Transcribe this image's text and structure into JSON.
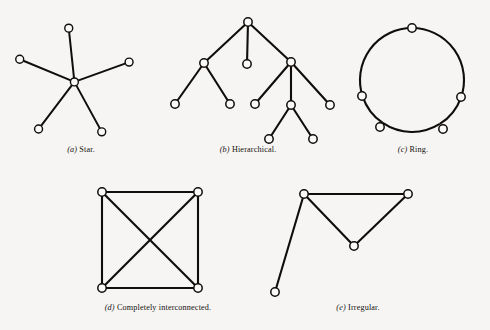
{
  "figure": {
    "background_color": "#f6f5f3",
    "ink_color": "#100d0b",
    "node_fill_color": "#faf9f7",
    "panels": [
      {
        "id": "star",
        "caption_tag": "(a)",
        "caption_text": "Star.",
        "topology": "star"
      },
      {
        "id": "hierarchical",
        "caption_tag": "(b)",
        "caption_text": "Hierarchical.",
        "topology": "tree"
      },
      {
        "id": "ring",
        "caption_tag": "(c)",
        "caption_text": "Ring.",
        "topology": "ring"
      },
      {
        "id": "completely-interconnected",
        "caption_tag": "(d)",
        "caption_text": "Completely interconnected.",
        "topology": "complete-graph"
      },
      {
        "id": "irregular",
        "caption_tag": "(e)",
        "caption_text": "Irregular.",
        "topology": "irregular"
      }
    ]
  },
  "chart_data": {
    "type": "diagram",
    "title": "",
    "subtitle": "",
    "diagram_kind": "network-topology-plate",
    "graphs": [
      {
        "id": "star",
        "label": "Star",
        "caption": "(a) Star.",
        "node_radius": 4.2,
        "node_count": 6,
        "edge_count": 5,
        "nodes": [
          {
            "id": "hub",
            "x": 72,
            "y": 72
          },
          {
            "id": "n-top",
            "x": 66,
            "y": 15
          },
          {
            "id": "n-left",
            "x": 14,
            "y": 48
          },
          {
            "id": "n-right",
            "x": 130,
            "y": 51
          },
          {
            "id": "n-bottom-left",
            "x": 34,
            "y": 122
          },
          {
            "id": "n-bottom-right",
            "x": 101,
            "y": 125
          }
        ],
        "edges": [
          [
            "hub",
            "n-top"
          ],
          [
            "hub",
            "n-left"
          ],
          [
            "hub",
            "n-right"
          ],
          [
            "hub",
            "n-bottom-left"
          ],
          [
            "hub",
            "n-bottom-right"
          ]
        ]
      },
      {
        "id": "hierarchical",
        "label": "Hierarchical",
        "caption": "(b) Hierarchical.",
        "node_radius": 4.2,
        "node_count": 11,
        "edge_count": 10,
        "nodes": [
          {
            "id": "root",
            "x": 90,
            "y": 14
          },
          {
            "id": "l1-left",
            "x": 46,
            "y": 55
          },
          {
            "id": "l1-mid",
            "x": 89,
            "y": 56
          },
          {
            "id": "l1-right",
            "x": 133,
            "y": 54
          },
          {
            "id": "l2-a",
            "x": 17,
            "y": 96
          },
          {
            "id": "l2-b",
            "x": 72,
            "y": 96
          },
          {
            "id": "l2-c",
            "x": 97,
            "y": 96
          },
          {
            "id": "l2-mid",
            "x": 133,
            "y": 97
          },
          {
            "id": "l2-d",
            "x": 172,
            "y": 97
          },
          {
            "id": "l3-a",
            "x": 111,
            "y": 131
          },
          {
            "id": "l3-b",
            "x": 155,
            "y": 131
          }
        ],
        "edges": [
          [
            "root",
            "l1-left"
          ],
          [
            "root",
            "l1-mid"
          ],
          [
            "root",
            "l1-right"
          ],
          [
            "l1-left",
            "l2-a"
          ],
          [
            "l1-left",
            "l2-b"
          ],
          [
            "l1-right",
            "l2-c"
          ],
          [
            "l1-right",
            "l2-mid"
          ],
          [
            "l1-right",
            "l2-d"
          ],
          [
            "l2-mid",
            "l3-a"
          ],
          [
            "l2-mid",
            "l3-b"
          ]
        ]
      },
      {
        "id": "ring",
        "label": "Ring",
        "caption": "(c) Ring.",
        "node_radius": 4.2,
        "node_count": 5,
        "edge_count": 5,
        "ring_center": {
          "x": 74,
          "y": 66
        },
        "ring_radius": 52,
        "nodes": [
          {
            "id": "r-top",
            "x": 74,
            "y": 14,
            "angle_deg": 270
          },
          {
            "id": "r-right",
            "x": 123,
            "y": 83,
            "angle_deg": 20
          },
          {
            "id": "r-bottom-right",
            "x": 105,
            "y": 115,
            "angle_deg": 71
          },
          {
            "id": "r-bottom-left",
            "x": 42,
            "y": 113,
            "angle_deg": 115
          },
          {
            "id": "r-left",
            "x": 24,
            "y": 82,
            "angle_deg": 162
          }
        ],
        "edges": [
          [
            "r-top",
            "r-right"
          ],
          [
            "r-right",
            "r-bottom-right"
          ],
          [
            "r-bottom-right",
            "r-bottom-left"
          ],
          [
            "r-bottom-left",
            "r-left"
          ],
          [
            "r-left",
            "r-top"
          ]
        ]
      },
      {
        "id": "completely-interconnected",
        "label": "Completely interconnected",
        "caption": "(d) Completely interconnected.",
        "node_radius": 4.2,
        "node_count": 4,
        "edge_count": 6,
        "nodes": [
          {
            "id": "c-top-left",
            "x": 44,
            "y": 14
          },
          {
            "id": "c-top-right",
            "x": 140,
            "y": 14
          },
          {
            "id": "c-bottom-left",
            "x": 44,
            "y": 110
          },
          {
            "id": "c-bottom-right",
            "x": 140,
            "y": 110
          }
        ],
        "edges": [
          [
            "c-top-left",
            "c-top-right"
          ],
          [
            "c-top-left",
            "c-bottom-left"
          ],
          [
            "c-top-right",
            "c-bottom-right"
          ],
          [
            "c-bottom-left",
            "c-bottom-right"
          ],
          [
            "c-top-left",
            "c-bottom-right"
          ],
          [
            "c-top-right",
            "c-bottom-left"
          ]
        ]
      },
      {
        "id": "irregular",
        "label": "Irregular",
        "caption": "(e) Irregular.",
        "node_radius": 4.2,
        "node_count": 4,
        "edge_count": 4,
        "nodes": [
          {
            "id": "i-apex-left",
            "x": 46,
            "y": 16
          },
          {
            "id": "i-apex-right",
            "x": 150,
            "y": 16
          },
          {
            "id": "i-valley",
            "x": 96,
            "y": 68
          },
          {
            "id": "i-pendant",
            "x": 17,
            "y": 114
          }
        ],
        "edges": [
          [
            "i-apex-left",
            "i-apex-right"
          ],
          [
            "i-apex-left",
            "i-valley"
          ],
          [
            "i-valley",
            "i-apex-right"
          ],
          [
            "i-apex-left",
            "i-pendant"
          ]
        ]
      }
    ]
  }
}
